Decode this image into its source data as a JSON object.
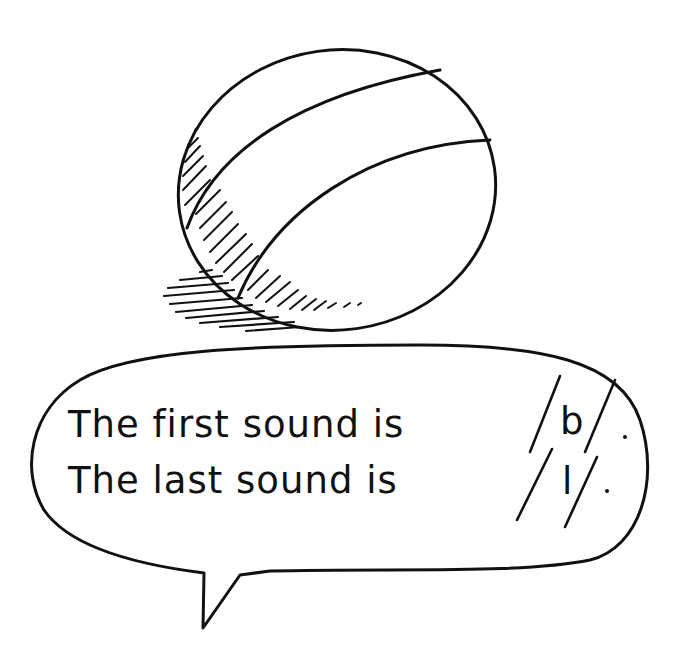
{
  "illustration": {
    "subject": "ball",
    "colors": {
      "ink": "#111111",
      "background": "#ffffff"
    }
  },
  "speech_bubble": {
    "line1": {
      "text": "The first sound is",
      "phoneme": "b",
      "end": "."
    },
    "line2": {
      "text": "The last sound is",
      "phoneme": "l",
      "end": "."
    }
  }
}
